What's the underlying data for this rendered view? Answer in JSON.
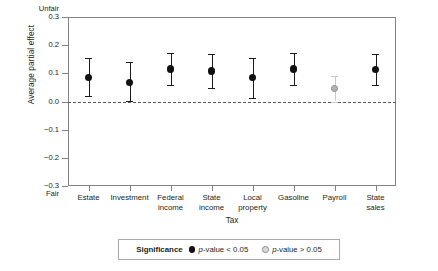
{
  "chart_data": {
    "type": "scatter",
    "title": "",
    "xlabel": "Tax",
    "ylabel": "Average partial effect",
    "ylim": [
      -0.3,
      0.3
    ],
    "grid": false,
    "zero_reference_line": true,
    "y_top_anchor_label": "Unfair",
    "y_bottom_anchor_label": "Fair",
    "y_ticks": [
      "0.3",
      "0.2",
      "0.1",
      "0.0",
      "-0.1",
      "-0.2",
      "-0.3"
    ],
    "y_tick_values": [
      0.3,
      0.2,
      0.1,
      0.0,
      -0.1,
      -0.2,
      -0.3
    ],
    "categories": [
      "Estate",
      "Investment",
      "Federal income",
      "State income",
      "Local property",
      "Gasoline",
      "Payroll",
      "State sales"
    ],
    "category_lines": [
      [
        "Estate"
      ],
      [
        "Investment"
      ],
      [
        "Federal",
        "income"
      ],
      [
        "State",
        "income"
      ],
      [
        "Local",
        "property"
      ],
      [
        "Gasoline"
      ],
      [
        "Payroll"
      ],
      [
        "State",
        "sales"
      ]
    ],
    "values": [
      0.086,
      0.068,
      0.115,
      0.108,
      0.086,
      0.116,
      0.046,
      0.113
    ],
    "ci_low": [
      0.018,
      0.002,
      0.058,
      0.048,
      0.014,
      0.059,
      0.0,
      0.059
    ],
    "ci_high": [
      0.155,
      0.139,
      0.172,
      0.168,
      0.155,
      0.173,
      0.092,
      0.169
    ],
    "significance": [
      "p-value < 0.05",
      "p-value < 0.05",
      "p-value < 0.05",
      "p-value < 0.05",
      "p-value < 0.05",
      "p-value < 0.05",
      "p-value > 0.05",
      "p-value < 0.05"
    ],
    "legend": {
      "position": "bottom",
      "title": "Significance",
      "entries": [
        {
          "label_prefix": "p",
          "label_rest": "-value < 0.05",
          "color": "#111111",
          "style": "filled"
        },
        {
          "label_prefix": "p",
          "label_rest": "-value > 0.05",
          "color": "#d9d9d9",
          "style": "open"
        }
      ]
    },
    "colors": {
      "significant": "#111111",
      "not_significant": "#b3b3b3",
      "axis": "#808285",
      "zero_line": "#58595b",
      "text": "#231f20"
    }
  }
}
